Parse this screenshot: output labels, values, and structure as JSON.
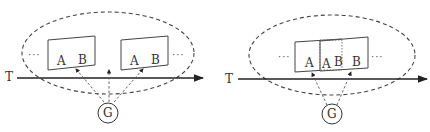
{
  "diagrams": [
    {
      "id": "left",
      "axis_label": "T",
      "circle_label": "G",
      "ellipsis_left": "···",
      "ellipsis_right": "···",
      "frames": [
        {
          "labels": [
            "A",
            "B"
          ]
        },
        {
          "labels": [
            "A",
            "B"
          ]
        }
      ]
    },
    {
      "id": "right",
      "axis_label": "T",
      "circle_label": "G",
      "ellipsis_left": "···",
      "ellipsis_right": "···",
      "frames": [
        {
          "labels": [
            "A",
            "A",
            "B",
            "B"
          ],
          "overlap": true
        }
      ]
    }
  ],
  "colors": {
    "stroke": "#333333",
    "dashed": "#444444",
    "text": "#333333"
  }
}
